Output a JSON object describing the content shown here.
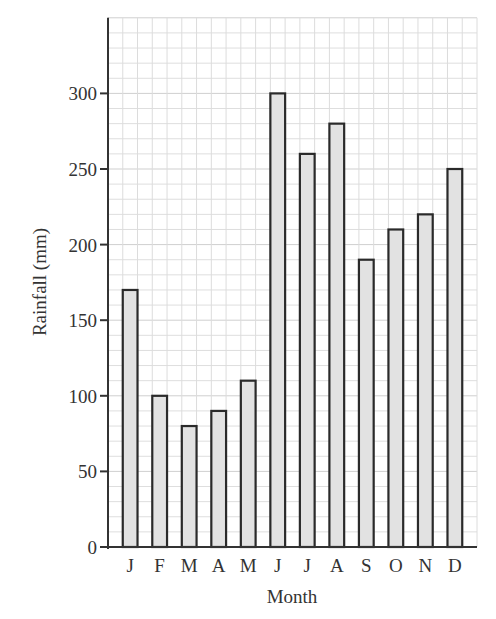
{
  "chart_data": {
    "type": "bar",
    "title": "",
    "xlabel": "Month",
    "ylabel": "Rainfall (mm)",
    "categories": [
      "J",
      "F",
      "M",
      "A",
      "M",
      "J",
      "J",
      "A",
      "S",
      "O",
      "N",
      "D"
    ],
    "values": [
      170,
      100,
      80,
      90,
      110,
      300,
      260,
      280,
      190,
      210,
      220,
      250
    ],
    "ylim": [
      0,
      350
    ],
    "yticks": [
      0,
      50,
      100,
      150,
      200,
      250,
      300
    ],
    "grid": true,
    "legend": null,
    "bar_fill": "#e2e2e2",
    "bar_stroke": "#2a2a2a"
  }
}
